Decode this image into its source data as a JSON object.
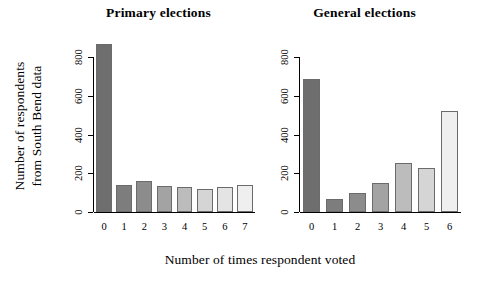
{
  "figure": {
    "xlabel": "Number of times respondent voted",
    "ylabel_line1": "Number of respondents",
    "ylabel_line2": "from South Bend data"
  },
  "panels": [
    {
      "title": "Primary elections"
    },
    {
      "title": "General elections"
    }
  ],
  "chart_data": [
    {
      "type": "bar",
      "title": "Primary elections",
      "xlabel": "Number of times respondent voted",
      "ylabel": "Number of respondents from South Bend data",
      "categories": [
        "0",
        "1",
        "2",
        "3",
        "4",
        "5",
        "6",
        "7"
      ],
      "values": [
        870,
        140,
        160,
        135,
        130,
        120,
        130,
        138
      ],
      "ylim": [
        0,
        900
      ],
      "yticks": [
        0,
        200,
        400,
        600,
        800
      ],
      "ytick_labels": [
        "0",
        "200",
        "400",
        "600",
        "800"
      ],
      "grid": false,
      "legend": "none",
      "bar_colors": [
        "#6e6e6e",
        "#7d7d7d",
        "#8c8c8c",
        "#a3a3a3",
        "#bcbcbc",
        "#d5d5d5",
        "#e4e4e4",
        "#efefef"
      ],
      "bar_border_color": "#6b6b6b"
    },
    {
      "type": "bar",
      "title": "General elections",
      "xlabel": "Number of times respondent voted",
      "ylabel": "Number of respondents from South Bend data",
      "categories": [
        "0",
        "1",
        "2",
        "3",
        "4",
        "5",
        "6"
      ],
      "values": [
        690,
        65,
        98,
        148,
        252,
        228,
        522
      ],
      "ylim": [
        0,
        900
      ],
      "yticks": [
        0,
        200,
        400,
        600,
        800
      ],
      "ytick_labels": [
        "0",
        "200",
        "400",
        "600",
        "800"
      ],
      "grid": false,
      "legend": "none",
      "bar_colors": [
        "#6e6e6e",
        "#7d7d7d",
        "#8c8c8c",
        "#a3a3a3",
        "#bcbcbc",
        "#d5d5d5",
        "#efefef"
      ],
      "bar_border_color": "#6b6b6b"
    }
  ]
}
